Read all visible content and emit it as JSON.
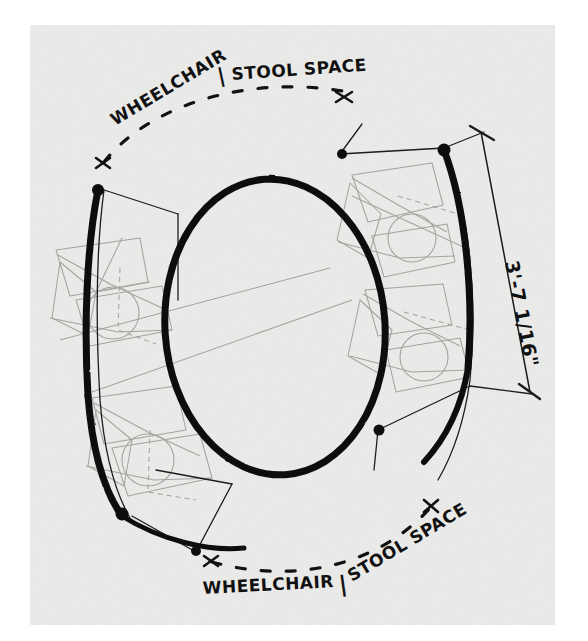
{
  "sheet": {
    "title": "Wheelchair / Stool Space Plan Sketch",
    "paper_color": "#ebebe9",
    "border_color": "#ffffff",
    "ink_color": "#111111",
    "pencil_color": "#9a9a97"
  },
  "annotations": {
    "top_label_left": "WHEELCHAIR",
    "top_label_divider": "|",
    "top_label_right": "STOOL SPACE",
    "bottom_label_left": "WHEELCHAIR",
    "bottom_label_divider": "|",
    "bottom_label_right": "STOOL SPACE"
  },
  "dimension": {
    "value": "3'-7 1/16\"",
    "feet": 3,
    "inches": 7,
    "fraction": "1/16"
  },
  "geometry": {
    "table": {
      "name": "oval-table",
      "cx": 275,
      "cy": 327,
      "rx": 110,
      "ry": 148,
      "rotation": -4,
      "stroke_width": 7
    },
    "bold_arcs": [
      {
        "name": "arc-upper-left",
        "stroke_width": 7
      },
      {
        "name": "arc-upper-right",
        "stroke_width": 7
      },
      {
        "name": "arc-lower-left",
        "stroke_width": 7
      },
      {
        "name": "arc-lower-right",
        "stroke_width": 7
      }
    ],
    "dashed_arcs": [
      {
        "name": "dashed-arc-top"
      },
      {
        "name": "dashed-arc-bottom"
      }
    ],
    "stool_circles": [
      {
        "name": "stool-circle-upper-right",
        "cx": 412,
        "cy": 238,
        "r": 24
      },
      {
        "name": "stool-circle-lower-right",
        "cx": 424,
        "cy": 357,
        "r": 24
      },
      {
        "name": "stool-circle-upper-left",
        "cx": 113,
        "cy": 313,
        "r": 26
      },
      {
        "name": "stool-circle-lower-left",
        "cx": 148,
        "cy": 460,
        "r": 26
      }
    ]
  }
}
